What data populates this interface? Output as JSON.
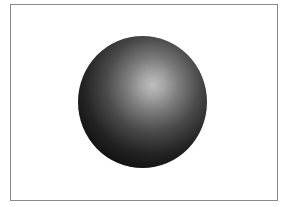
{
  "figure": {
    "frame": {
      "border_color": "#8a8a8a",
      "background": "#ffffff"
    },
    "sphere": {
      "center": [
        142,
        102
      ],
      "radius_x": 64,
      "radius_y": 66,
      "highlight_center": [
        153,
        85
      ],
      "colors": {
        "highlight": "#bdbdbd",
        "shadow": "#000000"
      }
    }
  }
}
